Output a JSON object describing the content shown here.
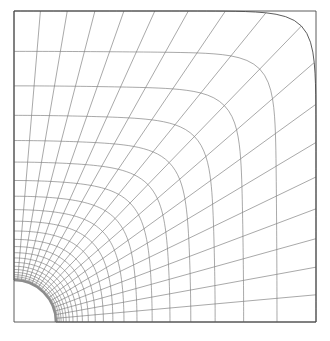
{
  "figure": {
    "type": "mesh-diagram",
    "background_color": "#ffffff",
    "line_color": "#6e6e6e",
    "boundary_color": "#4a4a4a",
    "hole_edge_color": "#8c8c8c"
  },
  "mesh_data": {
    "type": "structured-quad-mesh",
    "description": "Graded transfinite mesh mapping a quarter circular hole to a square outer boundary",
    "domain": {
      "x_min_px": 14,
      "y_min_px": 11,
      "x_max_px": 316,
      "y_max_px": 322,
      "width_px": 302,
      "height_px": 311
    },
    "hole": {
      "shape": "quarter-circle",
      "center_px": [
        14,
        322
      ],
      "radius_px": 42,
      "corner": "bottom-left",
      "angular_span_deg": 90
    },
    "divisions": {
      "angular": 18,
      "radial": 22
    },
    "radial_grading": {
      "scheme": "geometric",
      "ratio": 1.17,
      "finest_near": "hole",
      "coarsest_near": "outer-boundary"
    },
    "blend": {
      "inner_shape": "circle",
      "outer_shape": "square",
      "exponent_inner": 2.0,
      "exponent_outer": 14.0,
      "note": "superellipse exponent increases from 2 (circle) to large (square) with radial index"
    },
    "outer_boundary": {
      "left_edge": true,
      "top_edge": true,
      "right_edge": true,
      "bottom_edge": true
    }
  }
}
